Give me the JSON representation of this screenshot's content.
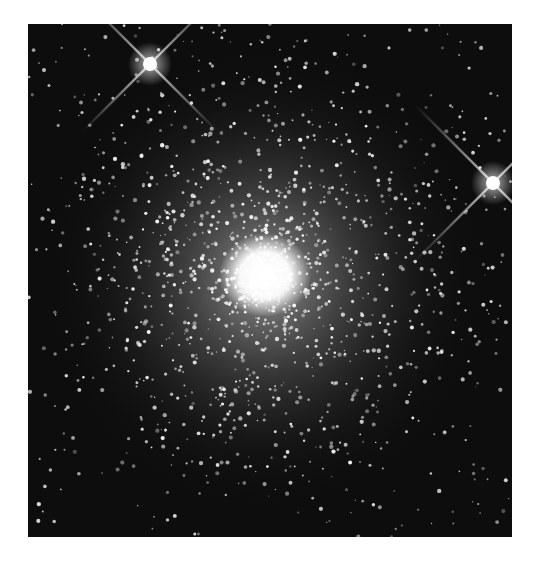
{
  "image": {
    "subject": "globular star cluster",
    "style": "grayscale astronomical photograph",
    "background_color": "#0d0d0d",
    "frame": {
      "left": 28,
      "top": 24,
      "width": 484,
      "height": 513
    },
    "features": {
      "cluster_core": {
        "cx": 237,
        "cy": 251,
        "label": "bright cluster core"
      },
      "foreground_star_1": {
        "cx": 122,
        "cy": 40,
        "label": "bright star with diffraction spikes (upper left)"
      },
      "foreground_star_2": {
        "cx": 465,
        "cy": 159,
        "label": "bright star with diffraction spikes (right edge)"
      }
    }
  }
}
